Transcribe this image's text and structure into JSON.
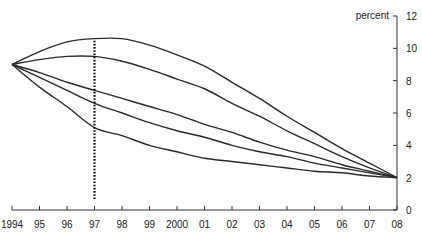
{
  "chart_data": {
    "type": "line",
    "title": "",
    "xlabel": "",
    "ylabel": "percent",
    "x": [
      1994,
      1995,
      1996,
      1997,
      1998,
      1999,
      2000,
      2001,
      2002,
      2003,
      2004,
      2005,
      2006,
      2007,
      2008
    ],
    "x_tick_labels": [
      "1994",
      "95",
      "96",
      "97",
      "98",
      "99",
      "2000",
      "01",
      "02",
      "03",
      "04",
      "05",
      "06",
      "07",
      "08"
    ],
    "y_ticks": [
      0,
      2,
      4,
      6,
      8,
      10,
      12
    ],
    "ylim": [
      0,
      12
    ],
    "y_axis_position": "right",
    "grid": false,
    "legend": null,
    "series": [
      {
        "name": "path 1",
        "values": [
          9.0,
          9.8,
          10.4,
          10.6,
          10.6,
          10.2,
          9.6,
          8.9,
          7.9,
          6.9,
          5.8,
          4.8,
          3.8,
          2.9,
          2.0
        ]
      },
      {
        "name": "path 2",
        "values": [
          9.0,
          9.3,
          9.5,
          9.5,
          9.2,
          8.7,
          8.1,
          7.5,
          6.6,
          5.8,
          4.9,
          4.1,
          3.3,
          2.6,
          2.0
        ]
      },
      {
        "name": "path 3",
        "values": [
          9.0,
          8.5,
          7.9,
          7.4,
          6.9,
          6.4,
          5.9,
          5.3,
          4.8,
          4.2,
          3.7,
          3.3,
          2.8,
          2.4,
          2.0
        ]
      },
      {
        "name": "path 4",
        "values": [
          9.0,
          8.2,
          7.4,
          6.6,
          6.0,
          5.4,
          4.9,
          4.5,
          4.0,
          3.6,
          3.3,
          2.9,
          2.6,
          2.3,
          2.0
        ]
      },
      {
        "name": "path 5",
        "values": [
          9.0,
          7.6,
          6.4,
          5.1,
          4.6,
          4.0,
          3.6,
          3.2,
          3.0,
          2.8,
          2.6,
          2.4,
          2.3,
          2.1,
          2.0
        ]
      }
    ],
    "annotations": [
      {
        "type": "vertical-dotted-line",
        "x": 1997,
        "y_from": 0.6,
        "y_to": 10.6
      }
    ]
  }
}
